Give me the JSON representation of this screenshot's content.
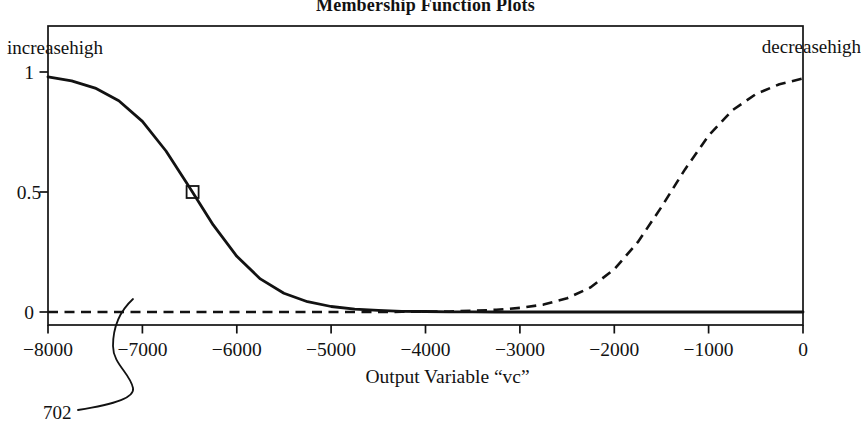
{
  "figure": {
    "title": "Membership Function Plots",
    "corner_label_left": "increasehigh",
    "corner_label_right": "decreasehigh",
    "x_axis_label": "Output Variable “vc”",
    "reference_label": "702"
  },
  "chart_data": {
    "type": "line",
    "title": "Membership Function Plots",
    "xlabel": "Output Variable “vc”",
    "ylabel": "",
    "xlim": [
      -8000,
      0
    ],
    "ylim": [
      -0.055,
      1.19
    ],
    "grid": false,
    "x_ticks": [
      -8000,
      -7000,
      -6000,
      -5000,
      -4000,
      -3000,
      -2000,
      -1000,
      0
    ],
    "x_tick_labels": [
      "−8000",
      "−7000",
      "−6000",
      "−5000",
      "−4000",
      "−3000",
      "−2000",
      "−1000",
      "0"
    ],
    "y_ticks": [
      0,
      0.5,
      1
    ],
    "y_tick_labels": [
      "0",
      "0.5",
      "1"
    ],
    "x": [
      -8000,
      -7750,
      -7500,
      -7250,
      -7000,
      -6750,
      -6500,
      -6250,
      -6000,
      -5750,
      -5500,
      -5250,
      -5000,
      -4750,
      -4500,
      -4250,
      -4000,
      -3750,
      -3500,
      -3250,
      -3000,
      -2750,
      -2500,
      -2250,
      -2000,
      -1750,
      -1500,
      -1250,
      -1000,
      -750,
      -500,
      -250,
      0
    ],
    "series": [
      {
        "name": "increasehigh",
        "style": "solid",
        "values": [
          0.98,
          0.963,
          0.933,
          0.88,
          0.794,
          0.671,
          0.519,
          0.363,
          0.232,
          0.138,
          0.078,
          0.043,
          0.023,
          0.012,
          0.007,
          0.003,
          0.002,
          0.001,
          0.001,
          0,
          0,
          0,
          0,
          0,
          0,
          0,
          0,
          0,
          0,
          0,
          0,
          0,
          0
        ]
      },
      {
        "name": "decreasehigh",
        "style": "dashed",
        "values": [
          0,
          0,
          0,
          0,
          0,
          0,
          0,
          0,
          0,
          0,
          0,
          0,
          0,
          0,
          0,
          0.001,
          0.001,
          0.002,
          0.005,
          0.009,
          0.017,
          0.031,
          0.057,
          0.103,
          0.178,
          0.291,
          0.437,
          0.594,
          0.735,
          0.84,
          0.908,
          0.949,
          0.973
        ]
      }
    ],
    "marker": {
      "series": "increasehigh",
      "shape": "open-square",
      "x": -6500,
      "y": 0.5
    },
    "annotations": [
      {
        "text": "702",
        "target_x": -7100,
        "target_y": 0.05
      }
    ],
    "legend": "none",
    "ink_color": "#121212"
  }
}
